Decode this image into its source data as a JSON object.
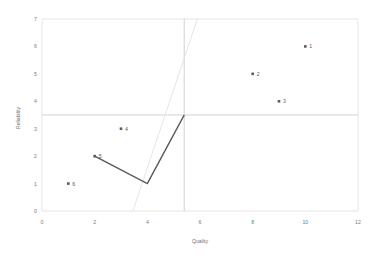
{
  "chart_data": {
    "type": "scatter",
    "title": "",
    "xlabel": "Quality",
    "ylabel": "Reliability",
    "xlim": [
      0,
      12
    ],
    "ylim": [
      0,
      7
    ],
    "xticks": [
      "0",
      "2",
      "4",
      "6",
      "8",
      "10",
      "12"
    ],
    "xtick_values": [
      0,
      2,
      4,
      6,
      8,
      10,
      12
    ],
    "yticks": [
      "0",
      "1",
      "2",
      "3",
      "4",
      "5",
      "6",
      "7"
    ],
    "ytick_values": [
      0,
      1,
      2,
      3,
      4,
      5,
      6,
      7
    ],
    "grid": false,
    "legend": "none",
    "points": [
      {
        "label": "1",
        "x": 10,
        "y": 6
      },
      {
        "label": "2",
        "x": 8,
        "y": 5
      },
      {
        "label": "3",
        "x": 9,
        "y": 4
      },
      {
        "label": "4",
        "x": 3,
        "y": 3
      },
      {
        "label": "5",
        "x": 2,
        "y": 2
      },
      {
        "label": "6",
        "x": 1,
        "y": 1
      }
    ],
    "series": [
      {
        "name": "path",
        "style": "solid-dark",
        "color": "#595959",
        "points": [
          {
            "x": 2,
            "y": 2
          },
          {
            "x": 4,
            "y": 1
          },
          {
            "x": 5.4,
            "y": 3.5
          }
        ]
      },
      {
        "name": "diagonal",
        "style": "solid-light",
        "color": "#e2e2e2",
        "points": [
          {
            "x": 3.45,
            "y": 0
          },
          {
            "x": 5.9,
            "y": 7
          }
        ]
      }
    ],
    "crosshair": {
      "vertical_x": 5.4,
      "horizontal_y": 3.5,
      "color": "#bfbfbf"
    },
    "plot_area": {
      "left": 42,
      "right": 358,
      "top": 19,
      "bottom": 211
    },
    "colors": {
      "marker": "#5c5c5c",
      "border": "#d9d9d9",
      "text": "#7a7a7a",
      "background": "#ffffff"
    }
  }
}
